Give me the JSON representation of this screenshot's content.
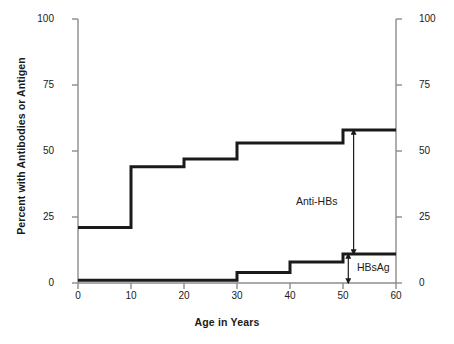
{
  "chart_data": {
    "type": "line",
    "subtype": "step",
    "title": "",
    "xlabel": "Age in Years",
    "ylabel": "Percent with Antibodies or Antigen",
    "xlim": [
      0,
      60
    ],
    "ylim": [
      0,
      100
    ],
    "xticks": [
      0,
      10,
      20,
      30,
      40,
      50,
      60
    ],
    "xtick_labels": [
      "0",
      "10",
      "20",
      "30",
      "40",
      "50",
      "60"
    ],
    "yticks": [
      0,
      25,
      50,
      75,
      100
    ],
    "ytick_labels": [
      "0",
      "25",
      "50",
      "75",
      "100"
    ],
    "y2ticks": [
      0,
      25,
      50,
      75,
      100
    ],
    "y2tick_labels": [
      "0",
      "25",
      "50",
      "75",
      "100"
    ],
    "grid": false,
    "legend": "none",
    "dual_y_axis": true,
    "series": [
      {
        "name": "Anti-HBs",
        "color": "#1a1a1a",
        "x_edges": [
          0,
          10,
          20,
          30,
          40,
          50,
          60
        ],
        "values": [
          21,
          44,
          47,
          53,
          53,
          58
        ]
      },
      {
        "name": "HBsAg",
        "color": "#1a1a1a",
        "x_edges": [
          0,
          10,
          20,
          30,
          40,
          50,
          60
        ],
        "values": [
          1,
          1,
          1,
          4,
          8,
          11
        ]
      }
    ],
    "annotations": [
      {
        "label": "Anti-HBs",
        "type": "double-arrow",
        "at_x": 52,
        "from_y": 11,
        "to_y": 58,
        "label_x": 42,
        "label_y": 33
      },
      {
        "label": "HBsAg",
        "type": "double-arrow",
        "at_x": 51,
        "from_y": 0,
        "to_y": 11,
        "label_x": 56,
        "label_y": 6
      }
    ]
  },
  "axes": {
    "left": {
      "label": "Percent with Antibodies or Antigen",
      "ticks": [
        "100",
        "75",
        "50",
        "25",
        "0"
      ]
    },
    "right": {
      "ticks": [
        "100",
        "75",
        "50",
        "25",
        "0"
      ]
    },
    "bottom": {
      "label": "Age in Years",
      "ticks": [
        "0",
        "10",
        "20",
        "30",
        "40",
        "50",
        "60"
      ]
    }
  },
  "annotations": {
    "anti_hbs": "Anti-HBs",
    "hbsag": "HBsAg"
  },
  "colors": {
    "line": "#1a1a1a",
    "axis": "#8c8c8c",
    "text": "#1a1a1a",
    "background": "#ffffff"
  }
}
